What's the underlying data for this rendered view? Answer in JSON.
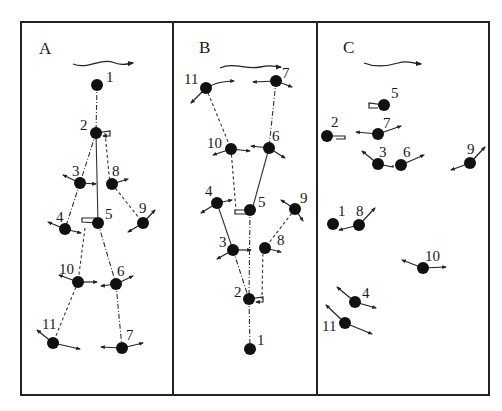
{
  "figure": {
    "colors": {
      "ink": "#111111",
      "background": "#ffffff"
    },
    "panels": [
      {
        "label": "A",
        "flow_arrow": "flow-right-arrow",
        "nodes": [
          {
            "id": "1",
            "x": 97,
            "y": 85
          },
          {
            "id": "2",
            "x": 96,
            "y": 133
          },
          {
            "id": "3",
            "x": 80,
            "y": 183
          },
          {
            "id": "8",
            "x": 112,
            "y": 184
          },
          {
            "id": "4",
            "x": 65,
            "y": 229
          },
          {
            "id": "5",
            "x": 98,
            "y": 223
          },
          {
            "id": "9",
            "x": 143,
            "y": 223
          },
          {
            "id": "10",
            "x": 78,
            "y": 282
          },
          {
            "id": "6",
            "x": 116,
            "y": 284
          },
          {
            "id": "11",
            "x": 53,
            "y": 343
          },
          {
            "id": "7",
            "x": 122,
            "y": 348
          }
        ]
      },
      {
        "label": "B",
        "flow_arrow": "flow-right-arrow",
        "nodes": [
          {
            "id": "11",
            "x": 206,
            "y": 88
          },
          {
            "id": "7",
            "x": 276,
            "y": 81
          },
          {
            "id": "10",
            "x": 231,
            "y": 149
          },
          {
            "id": "6",
            "x": 269,
            "y": 148
          },
          {
            "id": "4",
            "x": 217,
            "y": 203
          },
          {
            "id": "5",
            "x": 250,
            "y": 210
          },
          {
            "id": "9",
            "x": 295,
            "y": 209
          },
          {
            "id": "3",
            "x": 233,
            "y": 250
          },
          {
            "id": "8",
            "x": 265,
            "y": 248
          },
          {
            "id": "2",
            "x": 249,
            "y": 299
          },
          {
            "id": "1",
            "x": 250,
            "y": 349
          }
        ]
      },
      {
        "label": "C",
        "flow_arrow": "flow-right-arrow",
        "nodes": [
          {
            "id": "5",
            "x": 384,
            "y": 105
          },
          {
            "id": "7",
            "x": 378,
            "y": 134
          },
          {
            "id": "2",
            "x": 327,
            "y": 136
          },
          {
            "id": "3",
            "x": 378,
            "y": 164
          },
          {
            "id": "6",
            "x": 401,
            "y": 165
          },
          {
            "id": "9",
            "x": 470,
            "y": 163
          },
          {
            "id": "1",
            "x": 333,
            "y": 224
          },
          {
            "id": "8",
            "x": 359,
            "y": 225
          },
          {
            "id": "10",
            "x": 423,
            "y": 268
          },
          {
            "id": "4",
            "x": 355,
            "y": 302
          },
          {
            "id": "11",
            "x": 345,
            "y": 323
          }
        ]
      }
    ]
  }
}
